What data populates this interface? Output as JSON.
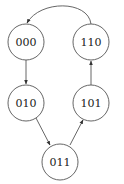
{
  "diagram": {
    "type": "state-transition",
    "nodes": [
      {
        "id": "000",
        "label": "000",
        "cx": 26,
        "cy": 42
      },
      {
        "id": "110",
        "label": "110",
        "cx": 91,
        "cy": 42
      },
      {
        "id": "010",
        "label": "010",
        "cx": 26,
        "cy": 103
      },
      {
        "id": "101",
        "label": "101",
        "cx": 91,
        "cy": 103
      },
      {
        "id": "011",
        "label": "011",
        "cx": 60,
        "cy": 162
      }
    ],
    "edges": [
      {
        "from": "000",
        "to": "010"
      },
      {
        "from": "010",
        "to": "011"
      },
      {
        "from": "011",
        "to": "101"
      },
      {
        "from": "101",
        "to": "110"
      },
      {
        "from": "110",
        "to": "000"
      }
    ],
    "colors": {
      "stroke": "#555555",
      "text": "#222222",
      "background": "#ffffff"
    }
  }
}
